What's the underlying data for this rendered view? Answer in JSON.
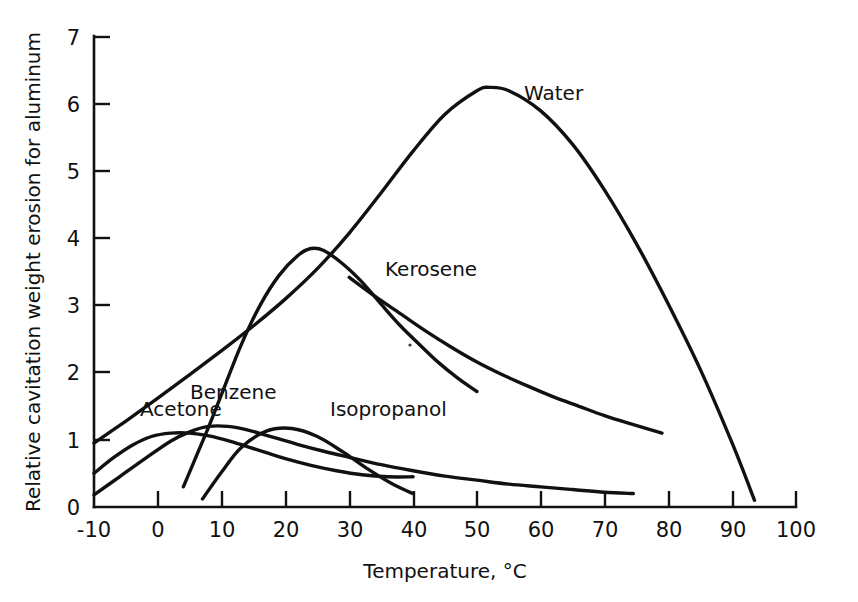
{
  "chart_data": {
    "type": "line",
    "title": "",
    "xlabel": "Temperature, °C",
    "ylabel": "Relative cavitation weight erosion for aluminum",
    "xlim": [
      -10,
      100
    ],
    "ylim": [
      0,
      7
    ],
    "xticks": [
      "-10",
      "0",
      "10",
      "20",
      "30",
      "40",
      "50",
      "60",
      "70",
      "80",
      "90",
      "100"
    ],
    "xtick_values": [
      -10,
      0,
      10,
      20,
      30,
      40,
      50,
      60,
      70,
      80,
      90,
      100
    ],
    "yticks": [
      "0",
      "1",
      "2",
      "3",
      "4",
      "5",
      "6",
      "7"
    ],
    "ytick_values": [
      0,
      1,
      2,
      3,
      4,
      5,
      6,
      7
    ],
    "grid": false,
    "legend_position": "inline-curve-labels",
    "series": [
      {
        "name": "Water",
        "label": "Water",
        "label_x": 62,
        "label_y": 6.35,
        "x": [
          -10,
          -5,
          0,
          5,
          10,
          15,
          20,
          25,
          30,
          35,
          40,
          45,
          50,
          52,
          55,
          60,
          65,
          70,
          75,
          80,
          85,
          90,
          93.5
        ],
        "y": [
          0.95,
          1.28,
          1.62,
          1.97,
          2.33,
          2.7,
          3.1,
          3.55,
          4.08,
          4.68,
          5.3,
          5.85,
          6.2,
          6.25,
          6.2,
          5.9,
          5.4,
          4.72,
          3.92,
          3.02,
          2.05,
          0.95,
          0.1
        ]
      },
      {
        "name": "Benzene",
        "label": "Benzene",
        "label_x": 19,
        "label_y": 2.22,
        "x": [
          4,
          6,
          8,
          10,
          13,
          16,
          19,
          22,
          24,
          26,
          29,
          32,
          35,
          38,
          41,
          44,
          47,
          50
        ],
        "y": [
          0.3,
          0.75,
          1.2,
          1.68,
          2.4,
          3.0,
          3.45,
          3.75,
          3.85,
          3.82,
          3.62,
          3.35,
          3.02,
          2.7,
          2.42,
          2.15,
          1.92,
          1.72
        ]
      },
      {
        "name": "Kerosene",
        "label": "Kerosene",
        "label_x": 39,
        "label_y": 3.45,
        "x": [
          30,
          34,
          38,
          42,
          46,
          50,
          54,
          58,
          62,
          66,
          70,
          74,
          79
        ],
        "y": [
          3.42,
          3.14,
          2.88,
          2.62,
          2.38,
          2.16,
          1.97,
          1.8,
          1.64,
          1.5,
          1.36,
          1.24,
          1.1
        ]
      },
      {
        "name": "Acetone",
        "label": "Acetone",
        "label_x": -4,
        "label_y": 1.62,
        "x": [
          -10,
          -7,
          -4,
          -1,
          2,
          5,
          8,
          11,
          14,
          17,
          20,
          24,
          28,
          32,
          36,
          40
        ],
        "y": [
          0.5,
          0.73,
          0.92,
          1.05,
          1.1,
          1.1,
          1.06,
          0.99,
          0.9,
          0.81,
          0.72,
          0.62,
          0.54,
          0.48,
          0.45,
          0.45
        ]
      },
      {
        "name": "Isopropanol",
        "label": "Isopropanol",
        "label_x": 31,
        "label_y": 1.62,
        "x": [
          -10,
          -6,
          -2,
          2,
          5,
          8,
          11,
          14,
          18,
          22,
          26,
          30,
          35,
          40,
          45,
          50,
          55,
          60,
          65,
          70,
          74.5
        ],
        "y": [
          0.18,
          0.45,
          0.72,
          0.98,
          1.12,
          1.2,
          1.2,
          1.15,
          1.04,
          0.93,
          0.83,
          0.74,
          0.63,
          0.54,
          0.46,
          0.4,
          0.34,
          0.3,
          0.26,
          0.22,
          0.2
        ]
      },
      {
        "name": "Acetone-secondary-short-tail",
        "label": "",
        "x": [
          7,
          10,
          13,
          17,
          21,
          25,
          29,
          33,
          37,
          40
        ],
        "y": [
          0.12,
          0.52,
          0.88,
          1.13,
          1.17,
          1.05,
          0.82,
          0.56,
          0.33,
          0.2
        ]
      }
    ]
  },
  "axes": {
    "x_title": "Temperature, °C",
    "y_title": "Relative cavitation weight erosion for aluminum"
  },
  "colors": {
    "ink": "#111111",
    "background": "#ffffff"
  }
}
